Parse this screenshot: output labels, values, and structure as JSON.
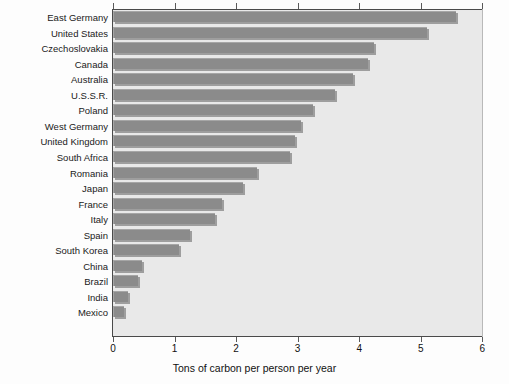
{
  "chart_data": {
    "type": "bar",
    "orientation": "horizontal",
    "title": "",
    "xlabel": "Tons of carbon per person per year",
    "ylabel": "",
    "xlim": [
      0,
      6
    ],
    "xticks": [
      0,
      1,
      2,
      3,
      4,
      5,
      6
    ],
    "xtick_labels": [
      "0",
      "1",
      "2",
      "3",
      "4",
      "5",
      "6"
    ],
    "grid": false,
    "legend": null,
    "categories": [
      "East Germany",
      "United States",
      "Czechoslovakia",
      "Canada",
      "Australia",
      "U.S.S.R.",
      "Poland",
      "West Germany",
      "United Kingdom",
      "South Africa",
      "Romania",
      "Japan",
      "France",
      "Italy",
      "Spain",
      "South Korea",
      "China",
      "Brazil",
      "India",
      "Mexico"
    ],
    "values": [
      5.57,
      5.1,
      4.24,
      4.15,
      3.9,
      3.6,
      3.25,
      3.05,
      2.95,
      2.88,
      2.34,
      2.11,
      1.77,
      1.66,
      1.25,
      1.08,
      0.47,
      0.4,
      0.25,
      0.18
    ],
    "bar_color": "#8b8b8b",
    "plot_background": "#e9e9e9",
    "axis_color": "#4a4a4a"
  },
  "axis": {
    "x_title": "Tons of carbon per person per year"
  }
}
